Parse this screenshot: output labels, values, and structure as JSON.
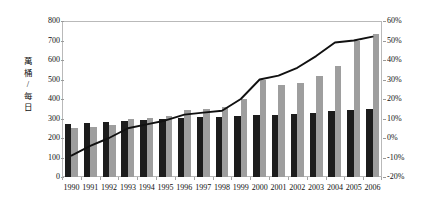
{
  "chart_data": {
    "type": "bar",
    "title": "",
    "subtitle": "",
    "xlabel": "",
    "ylabel": "萬桶 / 每日",
    "ylabel_chars": [
      "萬",
      "桶",
      "/",
      "每",
      "日"
    ],
    "categories": [
      "1990",
      "1991",
      "1992",
      "1993",
      "1994",
      "1995",
      "1996",
      "1997",
      "1998",
      "1999",
      "2000",
      "2001",
      "2002",
      "2003",
      "2004",
      "2005",
      "2006"
    ],
    "ylim": [
      0,
      800
    ],
    "yticks": [
      0,
      100,
      200,
      300,
      400,
      500,
      600,
      700,
      800
    ],
    "ytick_labels": [
      "0",
      "100",
      "200",
      "300",
      "400",
      "500",
      "600",
      "700",
      "800"
    ],
    "y2lim": [
      -20,
      60
    ],
    "y2ticks": [
      -20,
      -10,
      0,
      10,
      20,
      30,
      40,
      50,
      60
    ],
    "y2tick_labels": [
      "-20%",
      "-10%",
      "0%",
      "10%",
      "20%",
      "30%",
      "40%",
      "50%",
      "60%"
    ],
    "grid": false,
    "legend": "none",
    "series": [
      {
        "name": "primary-bar",
        "kind": "bar",
        "axis": "left",
        "color": "#1c1c1c",
        "values": [
          270,
          275,
          280,
          285,
          290,
          300,
          305,
          310,
          310,
          315,
          320,
          320,
          325,
          330,
          340,
          345,
          350
        ]
      },
      {
        "name": "secondary-bar",
        "kind": "bar",
        "axis": "left",
        "color": "#9e9e9e",
        "values": [
          250,
          255,
          265,
          300,
          305,
          315,
          345,
          350,
          360,
          400,
          500,
          470,
          480,
          520,
          570,
          700,
          735
        ]
      },
      {
        "name": "growth-line",
        "kind": "line",
        "axis": "right",
        "color": "#111111",
        "values": [
          -9,
          -4,
          0,
          5,
          7,
          9,
          12,
          13,
          14,
          20,
          30,
          32,
          36,
          42,
          49,
          50,
          52
        ]
      }
    ]
  }
}
